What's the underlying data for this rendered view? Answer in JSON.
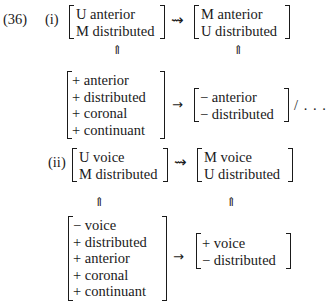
{
  "example_number": "(36)",
  "parts": [
    {
      "label": "(i)",
      "rule_left": [
        "U anterior",
        "M distributed"
      ],
      "rule_arrow": "squiggly-arrow",
      "rule_arrow_glyph": "⇝",
      "rule_right": [
        "M anterior",
        "U distributed"
      ],
      "link_glyph": "⇑",
      "input_matrix": [
        "+ anterior",
        "+ distributed",
        "+ coronal",
        "+ continuant"
      ],
      "output_arrow_glyph": "→",
      "output_matrix": [
        "− anterior",
        "− distributed"
      ],
      "context": "/ . . ."
    },
    {
      "label": "(ii)",
      "rule_left": [
        "U voice",
        "M distributed"
      ],
      "rule_arrow": "squiggly-arrow",
      "rule_arrow_glyph": "⇝",
      "rule_right": [
        "M voice",
        "U distributed"
      ],
      "link_glyph": "⇑",
      "input_matrix": [
        "− voice",
        "+ distributed",
        "+ anterior",
        "+ coronal",
        "+ continuant"
      ],
      "output_arrow_glyph": "→",
      "output_matrix": [
        "+ voice",
        "− distributed"
      ]
    }
  ]
}
